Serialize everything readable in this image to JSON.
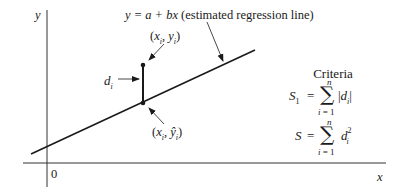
{
  "diagram": {
    "axes": {
      "y_label": "y",
      "x_label": "x",
      "origin_label": "0"
    },
    "regression_line_label": {
      "equation": "y = a + bx",
      "description": "(estimated regression line)"
    },
    "observed_point_label": "(x_i, y_i)",
    "fitted_point_label": "(x_i, ŷ_i)",
    "deviation_label": "d_i",
    "criteria": {
      "title": "Criteria",
      "formulas": [
        {
          "lhs": "S_1",
          "expression": "Σ_{i=1}^{n} |d_i|"
        },
        {
          "lhs": "S",
          "expression": "Σ_{i=1}^{n} d_i^2"
        }
      ]
    },
    "colors": {
      "ink": "#1a1a1a",
      "background": "#ffffff"
    }
  }
}
